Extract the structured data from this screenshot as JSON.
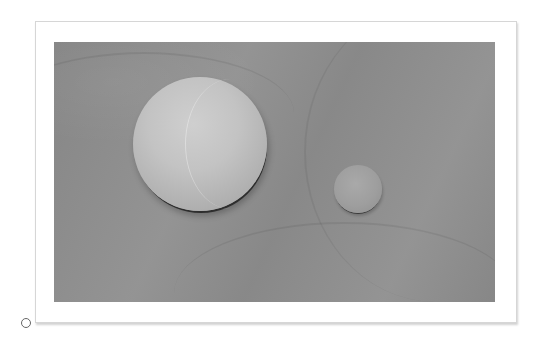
{
  "figure": {
    "objects": [
      {
        "name": "large-sphere",
        "label": ""
      },
      {
        "name": "small-sphere",
        "label": ""
      }
    ],
    "colors": {
      "background": "#ffffff",
      "frame_border": "#d6d6d6",
      "photo_surface": "#8e8e8e",
      "large_sphere": "#c3c3c3",
      "small_sphere": "#9e9e9e"
    }
  },
  "bullet_marker": {
    "shape": "hollow-circle"
  }
}
